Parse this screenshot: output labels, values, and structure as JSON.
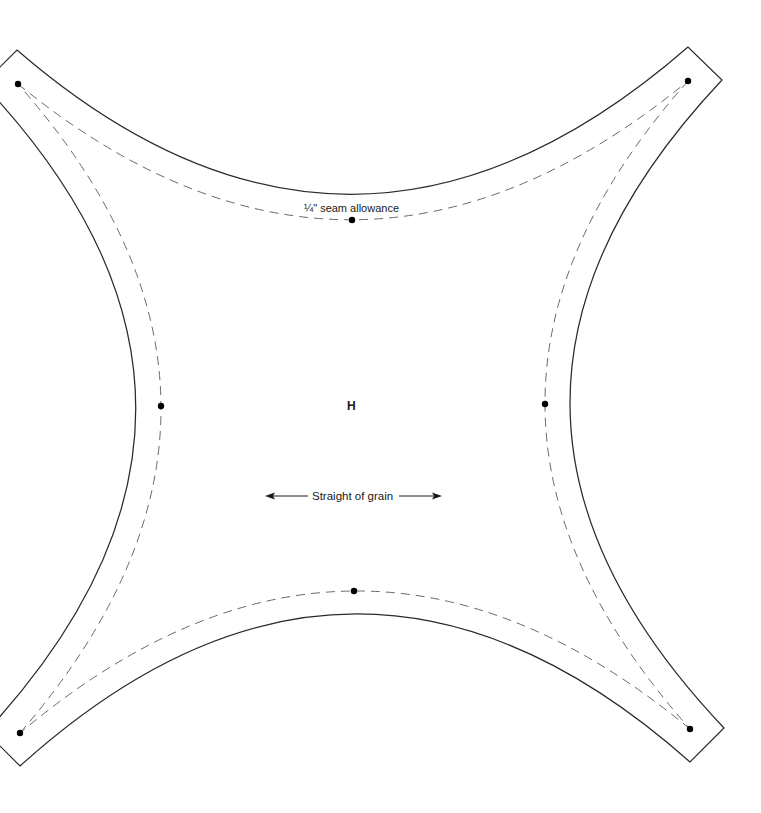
{
  "pattern": {
    "piece_letter": "H",
    "seam_label": "¼\" seam allowance",
    "grain_label": "Straight of grain",
    "colors": {
      "outline": "#2a2a2a",
      "seam": "#6a6a6a",
      "text": "#1a1a1a",
      "background": "#ffffff"
    },
    "markers": [
      {
        "name": "corner-top-left",
        "x": 18,
        "y": 84
      },
      {
        "name": "corner-top-right",
        "x": 688,
        "y": 81
      },
      {
        "name": "corner-bottom-left",
        "x": 20,
        "y": 733
      },
      {
        "name": "corner-bottom-right",
        "x": 690,
        "y": 729
      },
      {
        "name": "mid-top",
        "x": 352,
        "y": 220
      },
      {
        "name": "mid-left",
        "x": 161,
        "y": 406
      },
      {
        "name": "mid-right",
        "x": 545,
        "y": 404
      },
      {
        "name": "mid-bottom",
        "x": 354,
        "y": 591
      }
    ]
  }
}
